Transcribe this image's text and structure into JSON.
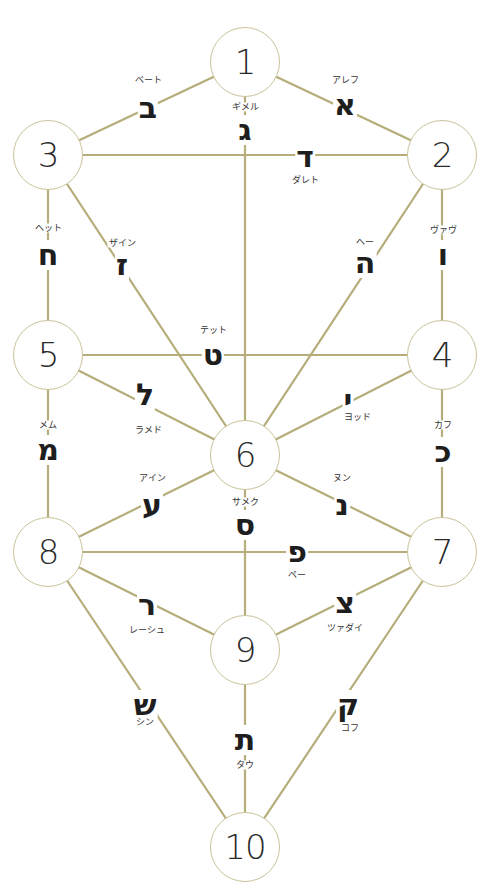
{
  "title": "",
  "line_color": "#b5ad7a",
  "circle_border_color": "#c9c29a",
  "sephirot": [
    {
      "id": 1,
      "label": "1",
      "x": 245,
      "y": 62
    },
    {
      "id": 2,
      "label": "2",
      "x": 442,
      "y": 155
    },
    {
      "id": 3,
      "label": "3",
      "x": 48,
      "y": 155
    },
    {
      "id": 4,
      "label": "4",
      "x": 442,
      "y": 355
    },
    {
      "id": 5,
      "label": "5",
      "x": 48,
      "y": 355
    },
    {
      "id": 6,
      "label": "6",
      "x": 245,
      "y": 455
    },
    {
      "id": 7,
      "label": "7",
      "x": 442,
      "y": 552
    },
    {
      "id": 8,
      "label": "8",
      "x": 48,
      "y": 552
    },
    {
      "id": 9,
      "label": "9",
      "x": 245,
      "y": 650
    },
    {
      "id": 10,
      "label": "10",
      "x": 245,
      "y": 847
    }
  ],
  "paths": [
    {
      "from": 1,
      "to": 2,
      "letter": "א",
      "name": "アレフ",
      "lx": 345,
      "ly": 105,
      "nx": 345,
      "ny": 80
    },
    {
      "from": 1,
      "to": 3,
      "letter": "ב",
      "name": "ベート",
      "lx": 148,
      "ly": 108,
      "nx": 148,
      "ny": 80
    },
    {
      "from": 1,
      "to": 6,
      "letter": "ג",
      "name": "ギメル",
      "lx": 245,
      "ly": 130,
      "nx": 245,
      "ny": 107
    },
    {
      "from": 2,
      "to": 3,
      "letter": "ד",
      "name": "ダレト",
      "lx": 305,
      "ly": 157,
      "nx": 305,
      "ny": 180
    },
    {
      "from": 2,
      "to": 6,
      "letter": "ה",
      "name": "ヘー",
      "lx": 365,
      "ly": 263,
      "nx": 365,
      "ny": 242
    },
    {
      "from": 2,
      "to": 4,
      "letter": "ו",
      "name": "ヴァヴ",
      "lx": 443,
      "ly": 255,
      "nx": 443,
      "ny": 230
    },
    {
      "from": 3,
      "to": 6,
      "letter": "ז",
      "name": "ザイン",
      "lx": 122,
      "ly": 265,
      "nx": 122,
      "ny": 243
    },
    {
      "from": 3,
      "to": 5,
      "letter": "ח",
      "name": "ヘット",
      "lx": 48,
      "ly": 255,
      "nx": 48,
      "ny": 228
    },
    {
      "from": 4,
      "to": 5,
      "letter": "ט",
      "name": "テット",
      "lx": 213,
      "ly": 355,
      "nx": 213,
      "ny": 330
    },
    {
      "from": 4,
      "to": 6,
      "letter": "י",
      "name": "ヨッド",
      "lx": 348,
      "ly": 400,
      "nx": 357,
      "ny": 417
    },
    {
      "from": 4,
      "to": 7,
      "letter": "כ",
      "name": "カフ",
      "lx": 443,
      "ly": 452,
      "nx": 443,
      "ny": 425
    },
    {
      "from": 5,
      "to": 6,
      "letter": "ל",
      "name": "ラメド",
      "lx": 145,
      "ly": 395,
      "nx": 148,
      "ny": 430
    },
    {
      "from": 5,
      "to": 8,
      "letter": "מ",
      "name": "メム",
      "lx": 48,
      "ly": 450,
      "nx": 48,
      "ny": 425
    },
    {
      "from": 6,
      "to": 7,
      "letter": "נ",
      "name": "ヌン",
      "lx": 342,
      "ly": 505,
      "nx": 342,
      "ny": 478
    },
    {
      "from": 6,
      "to": 9,
      "letter": "ס",
      "name": "サメク",
      "lx": 245,
      "ly": 525,
      "nx": 245,
      "ny": 502
    },
    {
      "from": 6,
      "to": 8,
      "letter": "ע",
      "name": "アイン",
      "lx": 152,
      "ly": 505,
      "nx": 152,
      "ny": 478
    },
    {
      "from": 7,
      "to": 8,
      "letter": "פ",
      "name": "ペー",
      "lx": 297,
      "ly": 552,
      "nx": 297,
      "ny": 575
    },
    {
      "from": 7,
      "to": 9,
      "letter": "צ",
      "name": "ツァダイ",
      "lx": 345,
      "ly": 603,
      "nx": 345,
      "ny": 628
    },
    {
      "from": 7,
      "to": 10,
      "letter": "ק",
      "name": "コフ",
      "lx": 348,
      "ly": 705,
      "nx": 350,
      "ny": 728
    },
    {
      "from": 8,
      "to": 9,
      "letter": "ר",
      "name": "レーシュ",
      "lx": 147,
      "ly": 605,
      "nx": 147,
      "ny": 630
    },
    {
      "from": 8,
      "to": 10,
      "letter": "ש",
      "name": "シン",
      "lx": 145,
      "ly": 705,
      "nx": 145,
      "ny": 722
    },
    {
      "from": 9,
      "to": 10,
      "letter": "ת",
      "name": "タウ",
      "lx": 245,
      "ly": 740,
      "nx": 245,
      "ny": 765
    }
  ]
}
